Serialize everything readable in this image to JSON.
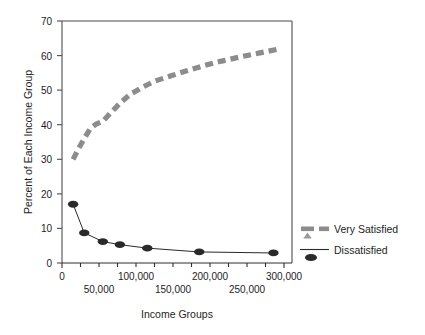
{
  "chart_data": {
    "type": "line",
    "title": "",
    "xlabel": "Income Groups",
    "ylabel": "Percent of Each Income Group",
    "xlim": [
      0,
      310000
    ],
    "ylim": [
      0,
      70
    ],
    "yticks": [
      0,
      10,
      20,
      30,
      40,
      50,
      60,
      70
    ],
    "ytick_labels": [
      "0",
      "10",
      "20",
      "30",
      "40",
      "50",
      "60",
      "70"
    ],
    "xticks_major": [
      0,
      50000,
      100000,
      150000,
      200000,
      250000,
      300000
    ],
    "xtick_labels_upper": [
      "0",
      "100,000",
      "200,000",
      "300,000"
    ],
    "xtick_labels_lower": [
      "50,000",
      "150,000",
      "250,000"
    ],
    "xticks_minor_step": 25000,
    "grid": false,
    "legend_position": "right-outside",
    "series": [
      {
        "name": "Very Satisfied",
        "style": "thick-dashed",
        "color": "#8c8c8c",
        "marker": "triangle",
        "x": [
          15000,
          22000,
          30000,
          38000,
          46000,
          55000,
          65000,
          78000,
          92000,
          108000,
          125000,
          145000,
          168000,
          190000,
          215000,
          240000,
          265000,
          290000
        ],
        "y": [
          30.0,
          33.0,
          36.0,
          38.8,
          40.2,
          41.0,
          43.3,
          46.2,
          48.8,
          50.8,
          52.6,
          54.0,
          55.6,
          57.0,
          58.4,
          59.6,
          60.7,
          61.8
        ]
      },
      {
        "name": "Dissatisfied",
        "style": "thin-solid",
        "color": "#2a2a2a",
        "marker": "ellipse",
        "x": [
          15000,
          30000,
          55000,
          78000,
          115000,
          185000,
          285000
        ],
        "y": [
          17.0,
          8.7,
          6.2,
          5.3,
          4.3,
          3.2,
          2.9
        ]
      }
    ],
    "legend_entries": [
      {
        "label": "Very Satisfied",
        "color": "#8c8c8c",
        "marker": "triangle",
        "style": "thick-dashed"
      },
      {
        "label": "Dissatisfied",
        "color": "#2a2a2a",
        "marker": "ellipse",
        "style": "thin-solid"
      }
    ]
  }
}
